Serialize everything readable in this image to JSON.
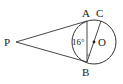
{
  "diagram": {
    "type": "geometry",
    "points": {
      "P": {
        "label": "P",
        "x": 14,
        "y": 42
      },
      "A": {
        "label": "A",
        "x": 87,
        "y": 21
      },
      "B": {
        "label": "B",
        "x": 87,
        "y": 62
      },
      "C": {
        "label": "C",
        "x": 101,
        "y": 21
      },
      "O": {
        "label": "O",
        "x": 94,
        "y": 42
      }
    },
    "circle": {
      "center": "O",
      "radius": 22
    },
    "segments": [
      "PA",
      "PB",
      "AB",
      "BC"
    ],
    "angle_label": {
      "text": "16°",
      "at": "angle ABC"
    },
    "colors": {
      "stroke": "#333333",
      "text": "#222222",
      "background": "#ffffff"
    }
  }
}
